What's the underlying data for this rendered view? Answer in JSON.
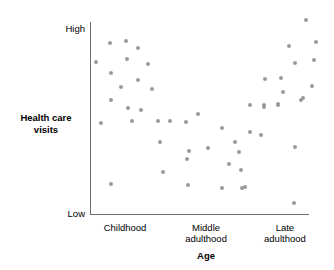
{
  "chart_data": {
    "type": "scatter",
    "title": "",
    "xlabel": "Age",
    "ylabel": "Health care visits",
    "grid": false,
    "legend": null,
    "x_tick_labels": [
      "Childhood",
      "Middle adulthood",
      "Late adulthood"
    ],
    "y_tick_labels": [
      "High",
      "Low"
    ],
    "xlim": [
      0,
      100
    ],
    "ylim": [
      0,
      100
    ],
    "axis_pixels": {
      "left": 90,
      "right": 309,
      "top": 22,
      "bottom": 214
    },
    "point_color": "#9a9a9a",
    "axis_color": "#6e6e6e",
    "points": [
      {
        "x": 9.1,
        "y": 89.1
      },
      {
        "x": 16.4,
        "y": 90.1
      },
      {
        "x": 21.9,
        "y": 86.5
      },
      {
        "x": 2.7,
        "y": 79.2
      },
      {
        "x": 16.9,
        "y": 80.7
      },
      {
        "x": 26.5,
        "y": 78.1
      },
      {
        "x": 9.6,
        "y": 73.4
      },
      {
        "x": 21.9,
        "y": 69.8
      },
      {
        "x": 14.2,
        "y": 66.1
      },
      {
        "x": 28.3,
        "y": 65.1
      },
      {
        "x": 9.6,
        "y": 59.4
      },
      {
        "x": 17.4,
        "y": 55.2
      },
      {
        "x": 23.3,
        "y": 54.2
      },
      {
        "x": 19.2,
        "y": 48.4
      },
      {
        "x": 31.1,
        "y": 48.4
      },
      {
        "x": 36.5,
        "y": 48.4
      },
      {
        "x": 43.8,
        "y": 47.9
      },
      {
        "x": 5.0,
        "y": 47.4
      },
      {
        "x": 32.0,
        "y": 37.5
      },
      {
        "x": 45.2,
        "y": 32.8
      },
      {
        "x": 44.3,
        "y": 28.6
      },
      {
        "x": 33.3,
        "y": 21.9
      },
      {
        "x": 9.6,
        "y": 15.6
      },
      {
        "x": 44.8,
        "y": 15.1
      },
      {
        "x": 49.3,
        "y": 52.1
      },
      {
        "x": 60.3,
        "y": 44.8
      },
      {
        "x": 73.1,
        "y": 56.8
      },
      {
        "x": 79.5,
        "y": 55.7
      },
      {
        "x": 85.8,
        "y": 57.3
      },
      {
        "x": 96.3,
        "y": 59.4
      },
      {
        "x": 73.1,
        "y": 42.7
      },
      {
        "x": 78.1,
        "y": 41.1
      },
      {
        "x": 66.2,
        "y": 37.5
      },
      {
        "x": 68.0,
        "y": 32.3
      },
      {
        "x": 53.9,
        "y": 34.4
      },
      {
        "x": 63.5,
        "y": 26.0
      },
      {
        "x": 68.9,
        "y": 22.9
      },
      {
        "x": 70.8,
        "y": 14.1
      },
      {
        "x": 60.3,
        "y": 13.5
      },
      {
        "x": 69.4,
        "y": 13.5
      },
      {
        "x": 93.6,
        "y": 34.9
      },
      {
        "x": 93.2,
        "y": 5.7
      },
      {
        "x": 98.6,
        "y": 101.0
      },
      {
        "x": 90.9,
        "y": 87.5
      },
      {
        "x": 103.2,
        "y": 89.6
      },
      {
        "x": 93.6,
        "y": 78.6
      },
      {
        "x": 102.3,
        "y": 80.2
      },
      {
        "x": 79.9,
        "y": 70.3
      },
      {
        "x": 87.2,
        "y": 70.8
      },
      {
        "x": 101.4,
        "y": 66.7
      },
      {
        "x": 88.1,
        "y": 63.5
      },
      {
        "x": 97.3,
        "y": 60.4
      },
      {
        "x": 79.5,
        "y": 56.8
      },
      {
        "x": 85.8,
        "y": 56.8
      }
    ]
  },
  "axes": {
    "y_title": "Health care visits",
    "y_title_line1": "Health care",
    "y_title_line2": "visits",
    "y_high": "High",
    "y_low": "Low",
    "x_title": "Age",
    "x_categories": [
      {
        "line1": "Childhood",
        "line2": ""
      },
      {
        "line1": "Middle",
        "line2": "adulthood"
      },
      {
        "line1": "Late",
        "line2": "adulthood"
      }
    ]
  }
}
